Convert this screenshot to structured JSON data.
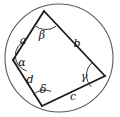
{
  "figure": {
    "kind": "cyclic-quadrilateral-inscribed-in-circle",
    "background_color": "#ffffff",
    "stroke_color": "#1a1a1a",
    "circle_stroke_color": "#4a4a4a",
    "circle": {
      "center_x": 59,
      "center_y": 58,
      "radius": 54
    },
    "vertices": {
      "top": {
        "x": 44,
        "y": 11
      },
      "left": {
        "x": 13,
        "y": 60
      },
      "bottom": {
        "x": 42,
        "y": 106
      },
      "right": {
        "x": 105,
        "y": 76
      }
    },
    "sides": [
      {
        "id": "a",
        "label": "a",
        "from": "left",
        "to": "top",
        "label_x": 23,
        "label_y": 44
      },
      {
        "id": "b",
        "label": "b",
        "from": "top",
        "to": "right",
        "label_x": 77,
        "label_y": 47
      },
      {
        "id": "c",
        "label": "c",
        "from": "bottom",
        "to": "right",
        "label_x": 73,
        "label_y": 100
      },
      {
        "id": "d",
        "label": "d",
        "from": "left",
        "to": "bottom",
        "label_x": 30,
        "label_y": 83
      }
    ],
    "angles": [
      {
        "id": "alpha",
        "label": "α",
        "vertex": "left",
        "label_x": 22,
        "label_y": 66
      },
      {
        "id": "beta",
        "label": "β",
        "vertex": "top",
        "label_x": 42,
        "label_y": 39
      },
      {
        "id": "gamma",
        "label": "γ",
        "vertex": "right",
        "label_x": 84,
        "label_y": 80
      },
      {
        "id": "delta",
        "label": "δ",
        "vertex": "bottom",
        "label_x": 43,
        "label_y": 93
      }
    ]
  }
}
